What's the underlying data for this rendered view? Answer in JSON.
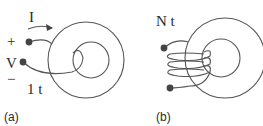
{
  "figure": {
    "panel_a": {
      "caption": "(a)",
      "current_label": "I",
      "plus_label": "+",
      "voltage_label": "V",
      "minus_label": "−",
      "turns_label": "1 t"
    },
    "panel_b": {
      "caption": "(b)",
      "turns_label": "N t"
    },
    "colors": {
      "stroke": "#555555",
      "text": "#2a2a2a",
      "background": "#ffffff"
    }
  }
}
